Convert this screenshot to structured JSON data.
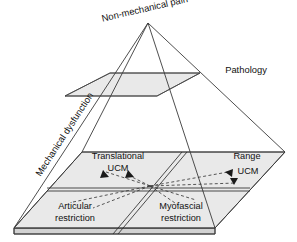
{
  "diagram": {
    "type": "pyramid-cross-section",
    "title_visible": false,
    "apex_label": "Non-mechanical pain",
    "left_edge_label": "Mechanical dysfunction",
    "right_upper_label": "Pathology",
    "base_quadrants": {
      "top_left": "Translational",
      "top_left_line2": "UCM",
      "top_right": "Range",
      "top_right_line2": "UCM",
      "bottom_left": "Articular",
      "bottom_left_line2": "restriction",
      "bottom_right": "Myofascial",
      "bottom_right_line2": "restriction"
    },
    "colors": {
      "plane_fill": "#e9e9e9",
      "slab_side": "#d2d2d2",
      "stroke": "#3a3a3a",
      "text": "#111111",
      "background": "#ffffff"
    },
    "icon_names": [
      "arrow-up-left-icon",
      "arrow-up-right-icon",
      "arrow-left-icon",
      "arrow-down-icon"
    ]
  }
}
